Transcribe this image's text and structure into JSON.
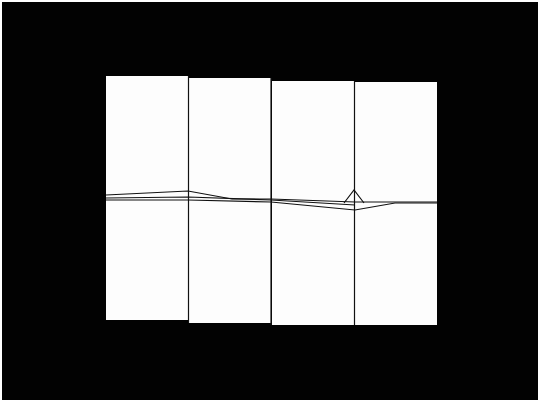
{
  "scene": {
    "description": "Four white folded sheets arranged side by side on black background, each divided horizontally by creased lines",
    "background_color": "#020202",
    "panel_color": "#fdfdfd",
    "line_color": "#111111",
    "panels": [
      {
        "x": 106,
        "y": 76,
        "w": 82,
        "h": 244
      },
      {
        "x": 189,
        "y": 78,
        "w": 82,
        "h": 245
      },
      {
        "x": 272,
        "y": 81,
        "w": 82,
        "h": 244
      },
      {
        "x": 355,
        "y": 82,
        "w": 82,
        "h": 243
      }
    ]
  }
}
